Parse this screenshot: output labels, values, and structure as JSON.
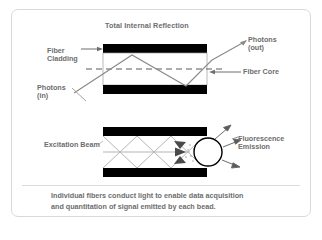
{
  "figure": {
    "domain": "diagram",
    "title": "Total Internal Reflection",
    "background_color": "#ffffff",
    "frame_color": "#d9d9d9",
    "text_color": "#6d6d6d",
    "cladding_color": "#000000",
    "core_color": "#ffffff",
    "ray_color": "#8a8a8a"
  },
  "upper_panel": {
    "title": "Total Internal Reflection",
    "labels": {
      "fiber_cladding": "Fiber\nCladding",
      "photons_in": "Photons\n(in)",
      "photons_out": "Photons\n(out)",
      "fiber_core": "Fiber Core"
    }
  },
  "lower_panel": {
    "labels": {
      "excitation_beam": "Excitation Beam",
      "fluorescence_emission": "Fluorescence\nEmission"
    },
    "bead": {
      "shape": "circle",
      "fill": "#ffffff",
      "stroke": "#000000"
    }
  },
  "caption": {
    "line1": "Individual fibers conduct light to enable data acquisition",
    "line2": "and quantitation of signal emitted by each bead."
  }
}
